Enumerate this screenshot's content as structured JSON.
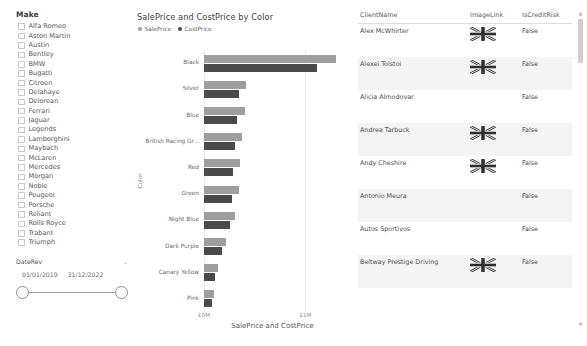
{
  "slicer": {
    "title": "Make",
    "items": [
      {
        "label": "Alfa Romeo",
        "checked": false
      },
      {
        "label": "Aston Martin",
        "checked": false
      },
      {
        "label": "Austin",
        "checked": false
      },
      {
        "label": "Bentley",
        "checked": false
      },
      {
        "label": "BMW",
        "checked": false
      },
      {
        "label": "Bugatti",
        "checked": false
      },
      {
        "label": "Citroen",
        "checked": false
      },
      {
        "label": "Delahaye",
        "checked": false
      },
      {
        "label": "Delorean",
        "checked": false
      },
      {
        "label": "Ferrari",
        "checked": false
      },
      {
        "label": "Jaguar",
        "checked": false
      },
      {
        "label": "Legends",
        "checked": false
      },
      {
        "label": "Lamborghini",
        "checked": false
      },
      {
        "label": "Maybach",
        "checked": false
      },
      {
        "label": "McLaren",
        "checked": false
      },
      {
        "label": "Mercedes",
        "checked": false
      },
      {
        "label": "Morgan",
        "checked": false
      },
      {
        "label": "Noble",
        "checked": false
      },
      {
        "label": "Peugeot",
        "checked": false
      },
      {
        "label": "Porsche",
        "checked": false
      },
      {
        "label": "Reliant",
        "checked": false
      },
      {
        "label": "Rolls Royce",
        "checked": false
      },
      {
        "label": "Trabant",
        "checked": false
      },
      {
        "label": "Triumph",
        "checked": false
      }
    ]
  },
  "date_slicer": {
    "title": "DateRev",
    "caret": "⌄",
    "start": "01/01/2019",
    "end": "31/12/2022"
  },
  "chart_data": {
    "type": "bar",
    "orientation": "horizontal",
    "title": "SalePrice and CostPrice by Color",
    "xlabel": "SalePrice and CostPrice",
    "ylabel": "Color",
    "xlim": [
      0,
      1350000
    ],
    "xticks": [
      0,
      1000000
    ],
    "xticklabels": [
      "£0M",
      "£1M"
    ],
    "grid": true,
    "legend_position": "top-left",
    "categories": [
      "Black",
      "Silver",
      "Blue",
      "British Racing Gr...",
      "Red",
      "Green",
      "Night Blue",
      "Dark Purple",
      "Canary Yellow",
      "Pink"
    ],
    "series": [
      {
        "name": "SalePrice",
        "color": "#9e9e9e",
        "values": [
          1300000,
          415000,
          400000,
          370000,
          355000,
          340000,
          310000,
          215000,
          135000,
          95000
        ]
      },
      {
        "name": "CostPrice",
        "color": "#4a4a4a",
        "values": [
          1110000,
          345000,
          330000,
          305000,
          290000,
          280000,
          255000,
          180000,
          110000,
          78000
        ]
      }
    ]
  },
  "table": {
    "columns": [
      "ClientName",
      "ImageLink",
      "IsCreditRisk"
    ],
    "rows": [
      {
        "name": "Alex McWhirter",
        "flag": true,
        "risk": "False"
      },
      {
        "name": "Alexei Tolstoi",
        "flag": true,
        "risk": "False"
      },
      {
        "name": "Alicia Almodovar",
        "flag": false,
        "risk": "False"
      },
      {
        "name": "Andrea Tarbuck",
        "flag": true,
        "risk": "False"
      },
      {
        "name": "Andy Cheshire",
        "flag": true,
        "risk": "False"
      },
      {
        "name": "Antonio Meura",
        "flag": false,
        "risk": "False"
      },
      {
        "name": "Autos Sportivos",
        "flag": false,
        "risk": "False"
      },
      {
        "name": "Beltway Prestige Driving",
        "flag": true,
        "risk": "False"
      }
    ]
  },
  "scrollbar": {
    "up_arrow": "▲",
    "down_arrow": "▼"
  }
}
